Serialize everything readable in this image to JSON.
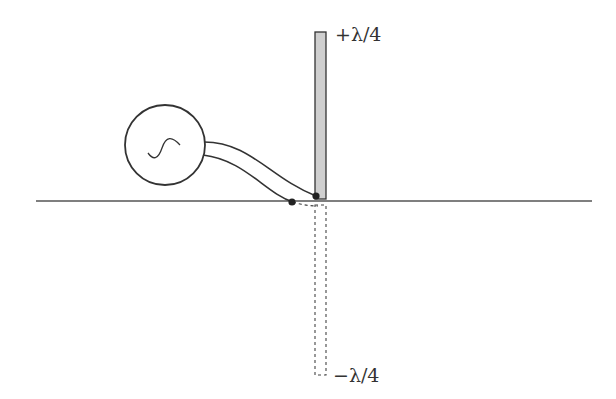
{
  "diagram": {
    "labels": {
      "top": "+λ/4",
      "bottom": "−λ/4"
    },
    "elements": {
      "source": "AC signal generator",
      "feed_line": "transmission line",
      "monopole": "λ/4 monopole antenna",
      "image": "image monopole (dashed)",
      "ground": "ground plane"
    },
    "colors": {
      "stroke": "#333333",
      "monopole_fill": "#cfcfcf"
    }
  }
}
